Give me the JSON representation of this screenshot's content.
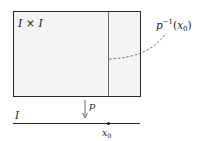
{
  "diagram": {
    "square_label": "I × I",
    "fiber_label_base": "p",
    "fiber_label_sup": "−1",
    "fiber_label_arg": "(x",
    "fiber_label_sub": "0",
    "fiber_label_close": ")",
    "projection_label": "p",
    "interval_label": "I",
    "point_label": "x",
    "point_sub": "0",
    "colors": {
      "fill": "#f4f4f4",
      "stroke": "#2a2a2a",
      "dashed": "#555555"
    }
  }
}
